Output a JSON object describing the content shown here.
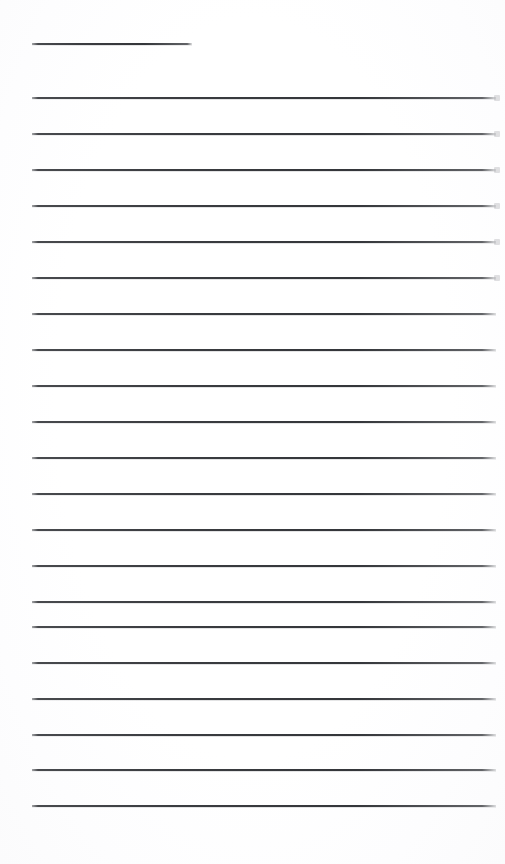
{
  "document": {
    "kind": "blank-ruled-page",
    "page_background_color": "#ffffff",
    "rule_color": "#3c3e42",
    "rule_thickness_px": 2,
    "page_width_px": 505,
    "page_height_px": 864,
    "visible_text": "",
    "heading_rule": {
      "name": "heading-underline",
      "x_px": 32,
      "y_px": 43,
      "width_px": 160
    },
    "body_rules_left_x_px": 32,
    "body_rules_right_x_px": 496,
    "body_rule_spacing_px": 35.5,
    "body_rule_count": 21,
    "body_rules": [
      {
        "y_px": 97,
        "nib": true
      },
      {
        "y_px": 133,
        "nib": true
      },
      {
        "y_px": 169,
        "nib": true
      },
      {
        "y_px": 205,
        "nib": true
      },
      {
        "y_px": 241,
        "nib": true
      },
      {
        "y_px": 277,
        "nib": true
      },
      {
        "y_px": 313,
        "nib": false
      },
      {
        "y_px": 349,
        "nib": false
      },
      {
        "y_px": 385,
        "nib": false
      },
      {
        "y_px": 421,
        "nib": false
      },
      {
        "y_px": 457,
        "nib": false
      },
      {
        "y_px": 493,
        "nib": false
      },
      {
        "y_px": 529,
        "nib": false
      },
      {
        "y_px": 565,
        "nib": false
      },
      {
        "y_px": 601,
        "nib": false
      },
      {
        "y_px": 626,
        "nib": false
      },
      {
        "y_px": 662,
        "nib": false
      },
      {
        "y_px": 698,
        "nib": false
      },
      {
        "y_px": 734,
        "nib": false
      },
      {
        "y_px": 769,
        "nib": false
      },
      {
        "y_px": 805,
        "nib": false
      }
    ]
  }
}
